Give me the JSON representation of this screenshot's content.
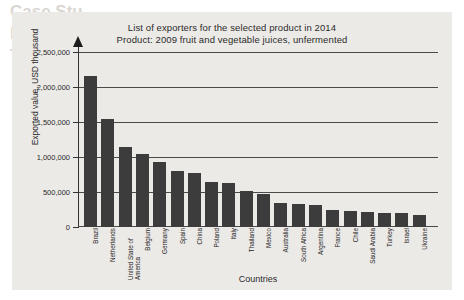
{
  "background_bleed": {
    "line1": "Case Stu",
    "line2": "he problem of Anti-dumping",
    "line3": "Tropical beverage",
    "line4": "ruce: Selected from Genesis Online",
    "line5": "Outline",
    "line6": "a product of socio-economic multilateral"
  },
  "chart_data": {
    "type": "bar",
    "title": "List of exporters for the selected product in 2014",
    "subtitle": "Product: 2009 fruit and vegetable juices, unfermented",
    "xlabel": "Countries",
    "ylabel": "Exported value, USD thousand",
    "ylim": [
      0,
      2500000
    ],
    "grid": true,
    "legend": "none",
    "ytick_labels": [
      "2,500,000",
      "2,000,000",
      "1,500,000",
      "1,000,000",
      "500,000",
      "0"
    ],
    "ytick_values": [
      2500000,
      2000000,
      1500000,
      1000000,
      500000,
      0
    ],
    "categories": [
      "Brazil",
      "Netherlands",
      "United State of America",
      "Belgium",
      "Germany",
      "Spain",
      "China",
      "Poland",
      "Italy",
      "Thailand",
      "Mexico",
      "Australia",
      "South Africa",
      "Argentina",
      "France",
      "Chile",
      "Saudi Arabia",
      "Turkey",
      "Israel",
      "Ukraine"
    ],
    "values": [
      2160000,
      1550000,
      1145000,
      1050000,
      930000,
      805000,
      765000,
      645000,
      625000,
      520000,
      465000,
      345000,
      325000,
      315000,
      250000,
      235000,
      215000,
      200000,
      198000,
      170000
    ],
    "bar_color": "#3c3c3c",
    "gridline_color": "#4a4a4a",
    "panel_color": "#eceae7"
  }
}
